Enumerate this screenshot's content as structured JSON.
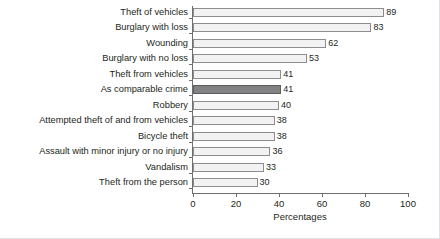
{
  "chart_data": {
    "type": "bar",
    "orientation": "horizontal",
    "title": "",
    "xlabel": "Percentages",
    "ylabel": "",
    "xlim": [
      0,
      100
    ],
    "xticks": [
      0,
      20,
      40,
      60,
      80,
      100
    ],
    "grid": false,
    "legend": null,
    "categories": [
      "Theft of vehicles",
      "Burglary with loss",
      "Wounding",
      "Burglary with no loss",
      "Theft from vehicles",
      "As comparable crime",
      "Robbery",
      "Attempted theft of and from vehicles",
      "Bicycle theft",
      "Assault with minor injury or no injury",
      "Vandalism",
      "Theft from the person"
    ],
    "values": [
      89,
      83,
      62,
      53,
      41,
      41,
      40,
      38,
      38,
      36,
      33,
      30
    ],
    "highlight_index": 5,
    "colors": {
      "bar_fill": "#f2f2f2",
      "bar_border": "#8d8d90",
      "highlight_fill": "#828285",
      "highlight_border": "#5c5c5f",
      "axis": "#6f6f72",
      "text": "#231f20",
      "background": "#ffffff"
    }
  }
}
